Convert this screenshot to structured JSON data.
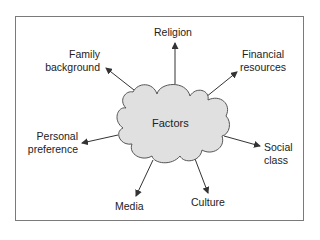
{
  "diagram": {
    "type": "mind-map",
    "center": {
      "label": "Factors",
      "shape": "cloud",
      "fill": "#e0e0e0",
      "stroke": "#555555"
    },
    "nodes": [
      {
        "id": "religion",
        "lines": [
          "Religion"
        ]
      },
      {
        "id": "family-background",
        "lines": [
          "Family",
          "background"
        ]
      },
      {
        "id": "financial-resources",
        "lines": [
          "Financial",
          "resources"
        ]
      },
      {
        "id": "personal-preference",
        "lines": [
          "Personal",
          "preference"
        ]
      },
      {
        "id": "social-class",
        "lines": [
          "Social",
          "class"
        ]
      },
      {
        "id": "media",
        "lines": [
          "Media"
        ]
      },
      {
        "id": "culture",
        "lines": [
          "Culture"
        ]
      }
    ],
    "edges": [
      {
        "from": "Factors",
        "to": "Religion"
      },
      {
        "from": "Factors",
        "to": "Family background"
      },
      {
        "from": "Factors",
        "to": "Financial resources"
      },
      {
        "from": "Factors",
        "to": "Personal preference"
      },
      {
        "from": "Factors",
        "to": "Social class"
      },
      {
        "from": "Factors",
        "to": "Media"
      },
      {
        "from": "Factors",
        "to": "Culture"
      }
    ],
    "colors": {
      "frame": "#7a7a7a",
      "arrow": "#333333",
      "text": "#222222"
    }
  }
}
